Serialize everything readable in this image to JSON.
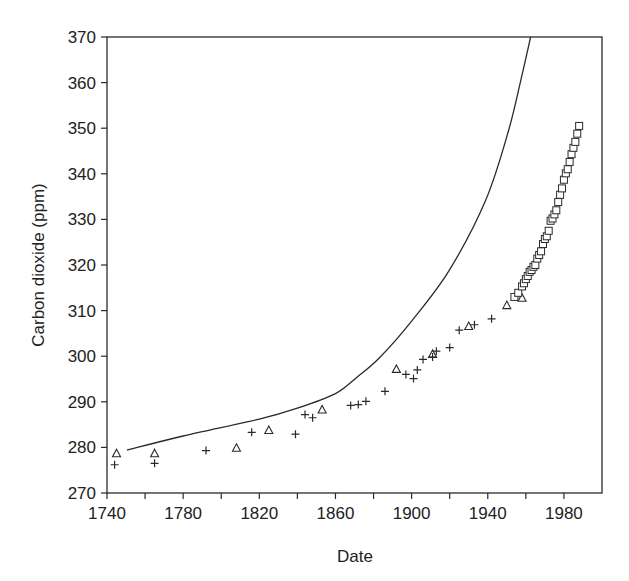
{
  "chart_data": {
    "type": "scatter",
    "title": "",
    "xlabel": "Date",
    "ylabel": "Carbon dioxide (ppm)",
    "xlim": [
      1740,
      2000
    ],
    "ylim": [
      270,
      370
    ],
    "x_ticks": [
      1740,
      1780,
      1820,
      1860,
      1900,
      1940,
      1980
    ],
    "x_minor_ticks": [
      1760,
      1800,
      1840,
      1880,
      1920,
      1960
    ],
    "y_ticks": [
      270,
      280,
      290,
      300,
      310,
      320,
      330,
      340,
      350,
      360,
      370
    ],
    "grid": false,
    "legend": null,
    "series": [
      {
        "name": "curve",
        "kind": "line",
        "points": [
          [
            1750.5,
            279.4
          ],
          [
            1780,
            282.5
          ],
          [
            1820,
            286.2
          ],
          [
            1840,
            288.6
          ],
          [
            1860,
            291.8
          ],
          [
            1871,
            295.3
          ],
          [
            1883,
            299.6
          ],
          [
            1900,
            307.7
          ],
          [
            1920,
            319.0
          ],
          [
            1939,
            334.3
          ],
          [
            1951,
            349.6
          ],
          [
            1958,
            361.7
          ],
          [
            1962.5,
            370
          ]
        ]
      },
      {
        "name": "plus",
        "kind": "marker",
        "marker": "+",
        "points": [
          [
            1744,
            276.2
          ],
          [
            1765,
            276.5
          ],
          [
            1792,
            279.3
          ],
          [
            1816,
            283.3
          ],
          [
            1839,
            282.9
          ],
          [
            1844,
            287.2
          ],
          [
            1848,
            286.5
          ],
          [
            1868,
            289.2
          ],
          [
            1872,
            289.4
          ],
          [
            1876,
            290.1
          ],
          [
            1886,
            292.3
          ],
          [
            1897,
            296.0
          ],
          [
            1901,
            295.1
          ],
          [
            1903,
            297.0
          ],
          [
            1906,
            299.3
          ],
          [
            1911,
            299.8
          ],
          [
            1913,
            301.1
          ],
          [
            1920,
            301.9
          ],
          [
            1925,
            305.7
          ],
          [
            1933,
            306.9
          ],
          [
            1942,
            308.2
          ]
        ]
      },
      {
        "name": "triangle",
        "kind": "marker",
        "marker": "triangle",
        "points": [
          [
            1745,
            278.6
          ],
          [
            1765,
            278.6
          ],
          [
            1808,
            279.8
          ],
          [
            1825,
            283.7
          ],
          [
            1853,
            288.2
          ],
          [
            1892,
            297.1
          ],
          [
            1911,
            300.4
          ],
          [
            1930,
            306.5
          ],
          [
            1950,
            311.1
          ],
          [
            1958,
            312.7
          ]
        ]
      },
      {
        "name": "square",
        "kind": "marker",
        "marker": "square",
        "points": [
          [
            1954,
            313.0
          ],
          [
            1956,
            313.9
          ],
          [
            1958,
            315.3
          ],
          [
            1959,
            316.0
          ],
          [
            1960,
            316.9
          ],
          [
            1961,
            317.6
          ],
          [
            1962,
            318.5
          ],
          [
            1963,
            318.9
          ],
          [
            1964,
            319.6
          ],
          [
            1965,
            320.0
          ],
          [
            1966,
            321.4
          ],
          [
            1967,
            322.2
          ],
          [
            1968,
            323.0
          ],
          [
            1969,
            324.6
          ],
          [
            1970,
            325.7
          ],
          [
            1971,
            326.3
          ],
          [
            1972,
            327.5
          ],
          [
            1973,
            329.7
          ],
          [
            1974,
            330.2
          ],
          [
            1975,
            331.1
          ],
          [
            1976,
            332.0
          ],
          [
            1977,
            333.8
          ],
          [
            1978,
            335.4
          ],
          [
            1979,
            336.8
          ],
          [
            1980,
            338.7
          ],
          [
            1981,
            340.1
          ],
          [
            1982,
            341.0
          ],
          [
            1983,
            342.6
          ],
          [
            1984,
            344.3
          ],
          [
            1985,
            345.7
          ],
          [
            1986,
            347.0
          ],
          [
            1987,
            348.8
          ],
          [
            1988,
            350.5
          ]
        ]
      }
    ]
  },
  "labels": {
    "xlabel": "Date",
    "ylabel": "Carbon dioxide (ppm)"
  }
}
